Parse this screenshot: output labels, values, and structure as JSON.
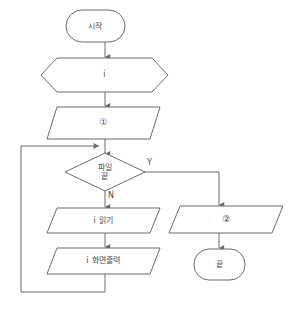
{
  "diagram": {
    "colors": {
      "stroke": "#6b6b6b",
      "text": "#4a4a4a",
      "background": "#ffffff"
    },
    "nodes": [
      {
        "id": "start",
        "type": "terminator",
        "label": "시작"
      },
      {
        "id": "declare",
        "type": "preparation",
        "label": "i"
      },
      {
        "id": "step1",
        "type": "input-output",
        "label": "①"
      },
      {
        "id": "decision",
        "type": "decision",
        "label_line1": "파일",
        "label_line2": "끝"
      },
      {
        "id": "read",
        "type": "input-output",
        "label": "i 읽기"
      },
      {
        "id": "display",
        "type": "input-output",
        "label": "i 화면출력"
      },
      {
        "id": "step2",
        "type": "input-output",
        "label": "②"
      },
      {
        "id": "end",
        "type": "terminator",
        "label": "끝"
      }
    ],
    "branch_labels": {
      "yes": "Y",
      "no": "N"
    }
  }
}
